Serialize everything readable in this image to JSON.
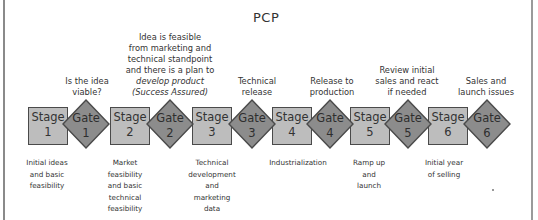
{
  "title": "PCP",
  "colors": {
    "stage_fill": "#bdbdbd",
    "gate_fill": "#8c8c8c",
    "outline": "#4a4a4a",
    "text": "#333333"
  },
  "gate_questions": [
    {
      "gate": 1,
      "lines": [
        "Is the idea",
        "viable?"
      ]
    },
    {
      "gate": 2,
      "lines": [
        "Idea is feasible",
        "from marketing and",
        "technical standpoint",
        "and there is a plan to",
        "develop product",
        "(Success Assured)"
      ]
    },
    {
      "gate": 3,
      "lines": [
        "Technical",
        "release"
      ]
    },
    {
      "gate": 4,
      "lines": [
        "Release to",
        "production"
      ]
    },
    {
      "gate": 5,
      "lines": [
        "Review initial",
        "sales and react",
        "if needed"
      ]
    },
    {
      "gate": 6,
      "lines": [
        "Sales and",
        "launch issues"
      ]
    }
  ],
  "stages": [
    {
      "label": "Stage",
      "number": "1",
      "description": [
        "Initial ideas",
        "and basic",
        "feasibility"
      ]
    },
    {
      "label": "Stage",
      "number": "2",
      "description": [
        "Market",
        "feasibility",
        "and basic",
        "technical",
        "feasibility"
      ]
    },
    {
      "label": "Stage",
      "number": "3",
      "description": [
        "Technical",
        "development",
        "and",
        "marketing",
        "data"
      ]
    },
    {
      "label": "Stage",
      "number": "4",
      "description": [
        "Industrialization"
      ]
    },
    {
      "label": "Stage",
      "number": "5",
      "description": [
        "Ramp up",
        "and",
        "launch"
      ]
    },
    {
      "label": "Stage",
      "number": "6",
      "description": [
        "Initial year",
        "of selling"
      ]
    }
  ],
  "gates": [
    {
      "label": "Gate",
      "number": "1"
    },
    {
      "label": "Gate",
      "number": "2"
    },
    {
      "label": "Gate",
      "number": "3"
    },
    {
      "label": "Gate",
      "number": "4"
    },
    {
      "label": "Gate",
      "number": "5"
    },
    {
      "label": "Gate",
      "number": "6"
    }
  ]
}
